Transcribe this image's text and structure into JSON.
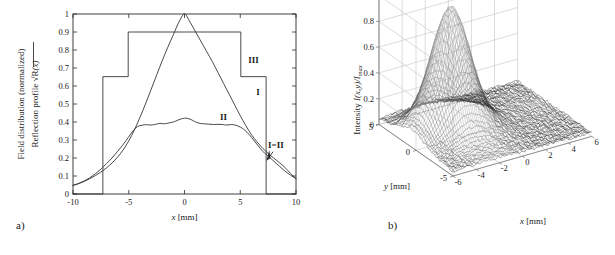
{
  "figure": {
    "panel_a_tag": "a)",
    "panel_b_tag": "b)"
  },
  "chart_data": [
    {
      "id": "panel-a",
      "type": "line",
      "title": "",
      "xlabel": "x [mm]",
      "ylabel_line1": "Field distribution (normalized)",
      "ylabel_line2": "Reflection profile √R(x)",
      "xlim": [
        -10,
        10
      ],
      "ylim": [
        0,
        1
      ],
      "xticks": [
        -10,
        -5,
        0,
        5,
        10
      ],
      "xticklabels": [
        "-10",
        "-5",
        "0",
        "5",
        "10"
      ],
      "yticks": [
        0,
        0.1,
        0.2,
        0.3,
        0.4,
        0.5,
        0.6,
        0.7,
        0.8,
        0.9,
        1
      ],
      "yticklabels": [
        "0",
        "0.1",
        "0.2",
        "0.3",
        "0.4",
        "0.5",
        "0.6",
        "0.7",
        "0.8",
        "0.9",
        "1"
      ],
      "grid": false,
      "legend": "inline-annotations",
      "annotations": [
        {
          "text": "III",
          "x": 6.2,
          "y": 0.73
        },
        {
          "text": "I",
          "x": 6.6,
          "y": 0.55
        },
        {
          "text": "II",
          "x": 3.5,
          "y": 0.41
        },
        {
          "text": "I=II",
          "x": 8.2,
          "y": 0.255
        }
      ],
      "series": [
        {
          "name": "III",
          "description": "Reflection profile, stepped rectangular apodization",
          "x": [
            -10,
            -7.32,
            -7.32,
            -5.05,
            -5.05,
            0,
            5.05,
            5.05,
            7.32,
            7.32,
            10
          ],
          "values": [
            0,
            0,
            0.652,
            0.652,
            0.9,
            0.9,
            0.9,
            0.652,
            0.652,
            0,
            0
          ]
        },
        {
          "name": "I",
          "description": "Field distribution I, broad bell curve peaking at 1",
          "x": [
            -10,
            -9.5,
            -9,
            -8.5,
            -8,
            -7.5,
            -7,
            -6.5,
            -6,
            -5.5,
            -5,
            -4.5,
            -4,
            -3.5,
            -3,
            -2.5,
            -2,
            -1.5,
            -1,
            -0.5,
            0,
            0.5,
            1,
            1.5,
            2,
            2.5,
            3,
            3.5,
            4,
            4.5,
            5,
            5.5,
            6,
            6.5,
            7,
            7.5,
            8,
            8.5,
            9,
            9.5,
            10
          ],
          "values": [
            0.048,
            0.058,
            0.07,
            0.085,
            0.102,
            0.122,
            0.145,
            0.172,
            0.205,
            0.245,
            0.295,
            0.355,
            0.425,
            0.5,
            0.58,
            0.66,
            0.74,
            0.815,
            0.885,
            0.955,
            1.0,
            0.955,
            0.9,
            0.845,
            0.79,
            0.735,
            0.675,
            0.615,
            0.555,
            0.495,
            0.435,
            0.38,
            0.33,
            0.29,
            0.255,
            0.225,
            0.2,
            0.175,
            0.148,
            0.115,
            0.085
          ]
        },
        {
          "name": "II",
          "description": "Field distribution II, flattened noisy plateau near 0.40",
          "x": [
            -10,
            -9.5,
            -9,
            -8.5,
            -8,
            -7.5,
            -7,
            -6.5,
            -6,
            -5.5,
            -5,
            -4.6,
            -4.2,
            -3.8,
            -3.4,
            -3,
            -2.6,
            -2.2,
            -1.8,
            -1.4,
            -1,
            -0.6,
            -0.2,
            0.2,
            0.6,
            1,
            1.4,
            1.8,
            2.2,
            2.6,
            3,
            3.4,
            3.8,
            4.2,
            4.6,
            5,
            5.4,
            5.8,
            6.2,
            6.6,
            7,
            7.3,
            7.6,
            8,
            8.5,
            9,
            9.5,
            10
          ],
          "values": [
            0.048,
            0.058,
            0.072,
            0.09,
            0.112,
            0.138,
            0.168,
            0.2,
            0.237,
            0.275,
            0.318,
            0.352,
            0.375,
            0.382,
            0.385,
            0.383,
            0.387,
            0.392,
            0.39,
            0.395,
            0.4,
            0.41,
            0.419,
            0.421,
            0.413,
            0.4,
            0.392,
            0.39,
            0.388,
            0.386,
            0.387,
            0.386,
            0.383,
            0.386,
            0.382,
            0.372,
            0.355,
            0.33,
            0.3,
            0.268,
            0.238,
            0.222,
            0.205,
            0.183,
            0.155,
            0.128,
            0.105,
            0.085
          ]
        }
      ]
    },
    {
      "id": "panel-b",
      "type": "surface",
      "title": "",
      "xlabel": "x [mm]",
      "ylabel": "y [mm]",
      "zlabel": "Intensity I(x,y)/I_max",
      "xlim": [
        -6,
        6
      ],
      "ylim": [
        -5,
        5
      ],
      "zlim": [
        0,
        1
      ],
      "xticks": [
        -6,
        -4,
        -2,
        0,
        2,
        4,
        6
      ],
      "xticklabels": [
        "-6",
        "-4",
        "-2",
        "0",
        "2",
        "4",
        "6"
      ],
      "yticks": [
        -5,
        0,
        5
      ],
      "yticklabels": [
        "-5",
        "0",
        "5"
      ],
      "zticks": [
        0,
        0.2,
        0.4,
        0.6,
        0.8,
        1
      ],
      "zticklabels": [
        "0",
        "0.2",
        "0.4",
        "0.6",
        "0.8",
        "1"
      ],
      "grid": true,
      "peak_value": 0.85,
      "peak_x": -2.6,
      "peak_y": 0.6,
      "noise_floor": 0.03,
      "mesh_color": "#2f2f2f"
    }
  ]
}
